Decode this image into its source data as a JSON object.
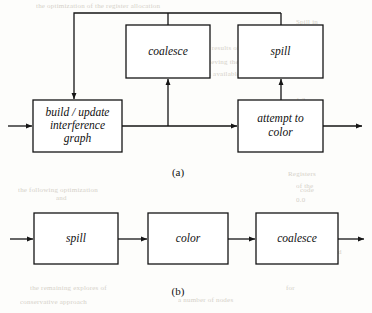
{
  "figure": {
    "captions": {
      "a": "(a)",
      "b": "(b)"
    }
  },
  "diagram_a": {
    "caption": "(a)",
    "nodes": [
      {
        "id": "build",
        "label": "build / update\ninterference\ngraph",
        "lines": [
          "build / update",
          "interference",
          "graph"
        ],
        "x": 33,
        "y": 100,
        "w": 89,
        "h": 52
      },
      {
        "id": "coalesce",
        "label": "coalesce",
        "lines": [
          "coalesce"
        ],
        "x": 126,
        "y": 25,
        "w": 84,
        "h": 53
      },
      {
        "id": "spill",
        "label": "spill",
        "lines": [
          "spill"
        ],
        "x": 238,
        "y": 25,
        "w": 85,
        "h": 53
      },
      {
        "id": "attempt",
        "label": "attempt to\ncolor",
        "lines": [
          "attempt to",
          "color"
        ],
        "x": 238,
        "y": 100,
        "w": 85,
        "h": 52
      }
    ],
    "edges": [
      {
        "from": "input",
        "to": "build",
        "kind": "arrow-right"
      },
      {
        "from": "build",
        "to": "attempt",
        "kind": "arrow-right"
      },
      {
        "from": "main-line",
        "to": "coalesce",
        "kind": "arrow-up"
      },
      {
        "from": "attempt",
        "to": "spill",
        "kind": "arrow-up"
      },
      {
        "from": "coalesce-and-spill",
        "to": "build",
        "kind": "feedback-arrow-down"
      },
      {
        "from": "attempt",
        "to": "output",
        "kind": "arrow-right"
      }
    ]
  },
  "diagram_b": {
    "caption": "(b)",
    "nodes": [
      {
        "id": "spill",
        "label": "spill",
        "x": 34,
        "y": 213,
        "w": 84,
        "h": 51
      },
      {
        "id": "color",
        "label": "color",
        "x": 148,
        "y": 213,
        "w": 80,
        "h": 51
      },
      {
        "id": "coalesce",
        "label": "coalesce",
        "x": 256,
        "y": 213,
        "w": 82,
        "h": 51
      }
    ],
    "edges": [
      {
        "from": "input",
        "to": "spill",
        "kind": "arrow-right"
      },
      {
        "from": "spill",
        "to": "color",
        "kind": "arrow-right"
      },
      {
        "from": "color",
        "to": "coalesce",
        "kind": "arrow-right"
      },
      {
        "from": "coalesce",
        "to": "output",
        "kind": "arrow-right"
      }
    ]
  },
  "bleed_through": [
    {
      "text": "the optimization of the register allocation",
      "x": 36,
      "y": 2
    },
    {
      "text": "Spill in",
      "x": 296,
      "y": 18
    },
    {
      "text": "is clear to see in the results of",
      "x": 150,
      "y": 44
    },
    {
      "text": "Conservative",
      "x": 276,
      "y": 44
    },
    {
      "text": "the best results, achieving the",
      "x": 150,
      "y": 58
    },
    {
      "text": "for the spill",
      "x": 288,
      "y": 58
    },
    {
      "text": "and the fewest spills available",
      "x": 150,
      "y": 70
    },
    {
      "text": "the",
      "x": 296,
      "y": 70
    },
    {
      "text": "1.2",
      "x": 296,
      "y": 96
    },
    {
      "text": "2.1",
      "x": 296,
      "y": 108
    },
    {
      "text": "1.9",
      "x": 296,
      "y": 120
    },
    {
      "text": "2.4 with a",
      "x": 284,
      "y": 132
    },
    {
      "text": "0.8",
      "x": 296,
      "y": 144
    },
    {
      "text": "Registers",
      "x": 288,
      "y": 170
    },
    {
      "text": "of the",
      "x": 296,
      "y": 182
    },
    {
      "text": "0.0",
      "x": 296,
      "y": 196
    },
    {
      "text": "the following optimization",
      "x": 18,
      "y": 186
    },
    {
      "text": "and",
      "x": 56,
      "y": 194
    },
    {
      "text": "code",
      "x": 300,
      "y": 186
    },
    {
      "text": "coalescing and the",
      "x": 172,
      "y": 222
    },
    {
      "text": "structure",
      "x": 290,
      "y": 222
    },
    {
      "text": "spill",
      "x": 88,
      "y": 232
    },
    {
      "text": "case",
      "x": 40,
      "y": 222
    },
    {
      "text": "code  4. 4+ Mid",
      "x": 296,
      "y": 248
    },
    {
      "text": "the remaining explores of",
      "x": 30,
      "y": 284
    },
    {
      "text": "for",
      "x": 286,
      "y": 284
    },
    {
      "text": "a number of nodes",
      "x": 178,
      "y": 296
    },
    {
      "text": "conservative approach",
      "x": 20,
      "y": 298
    }
  ]
}
